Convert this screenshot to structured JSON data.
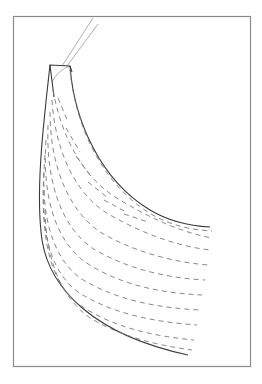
{
  "diagram": {
    "colors": {
      "background": "#ffffff",
      "frame": "#8a8a8a",
      "solid_line": "#3a3a3a",
      "dashed_line": "#7a7a7a",
      "thin_line": "#9a9a9a"
    },
    "frame": {
      "x": 13,
      "y": 16,
      "width": 238,
      "height": 351
    },
    "elements": [
      "frame-border",
      "stem-lines",
      "top-cap",
      "outer-edge",
      "inner-edge",
      "dashed-contours"
    ]
  }
}
